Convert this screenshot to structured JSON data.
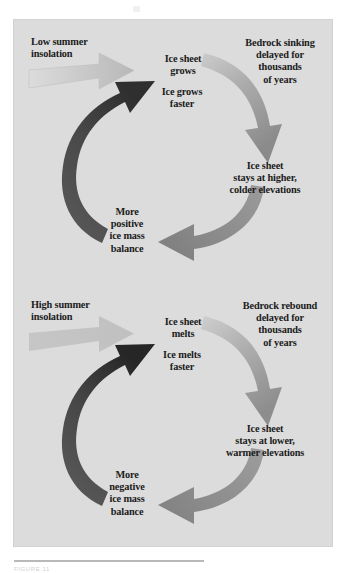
{
  "figure": {
    "background_color": "#ffffff",
    "panel_color": "#dcdcdc",
    "text_color": "#1b1b1b",
    "caption": "FIGURE 11"
  },
  "colors": {
    "input_arrow_light": "#c7c7c7",
    "input_arrow_fade": "#e8e8e8",
    "curve_arrow_light": "#c2c2c2",
    "curve_arrow_mid": "#8d8d8d",
    "curve_arrow_dark": "#6e6e6e",
    "feedback_arrow_dark": "#4a4a4a",
    "feedback_arrow_darker": "#2c2c2c"
  },
  "diagram_data": {
    "type": "diagram",
    "title": "Ice sheet and bedrock delayed-response feedback cycles",
    "cycles": [
      {
        "id": "glacial-growth",
        "name": "Low summer insolation positive feedback cycle",
        "input": {
          "label": "Low summer\ninsolation",
          "arrow": "gradient-fade-right",
          "arrow_color": "#c7c7c7"
        },
        "nodes": [
          {
            "id": "ice-sheet-grows",
            "label": "Ice sheet\ngrows",
            "position": "top-center"
          },
          {
            "id": "bedrock-sinking",
            "label": "Bedrock sinking\ndelayed for\nthousands\nof years",
            "position": "top-right"
          },
          {
            "id": "stays-higher",
            "label": "Ice sheet\nstays at higher,\ncolder elevations",
            "position": "bottom-right"
          },
          {
            "id": "mass-balance-positive",
            "label": "More\npositive\nice mass\nbalance",
            "position": "bottom-left"
          },
          {
            "id": "ice-grows-faster",
            "label": "Ice grows\nfaster",
            "position": "center-left"
          }
        ],
        "arrows": [
          {
            "id": "arrow-grows-to-bedrock",
            "from": "ice-sheet-grows",
            "to": "stays-higher",
            "style": "curved-clockwise",
            "shade": "light-to-mid"
          },
          {
            "id": "arrow-stays-to-balance",
            "from": "stays-higher",
            "to": "mass-balance-positive",
            "style": "curved-clockwise",
            "shade": "mid"
          },
          {
            "id": "arrow-balance-to-faster",
            "from": "mass-balance-positive",
            "to": "ice-grows-faster",
            "style": "curved-clockwise-dark",
            "shade": "dark"
          }
        ]
      },
      {
        "id": "deglaciation",
        "name": "High summer insolation negative feedback cycle",
        "input": {
          "label": "High summer\ninsolation",
          "arrow": "solid-light",
          "arrow_color": "#c7c7c7"
        },
        "nodes": [
          {
            "id": "ice-sheet-melts",
            "label": "Ice sheet\nmelts",
            "position": "top-center"
          },
          {
            "id": "bedrock-rebound",
            "label": "Bedrock rebound\ndelayed for\nthousands\nof years",
            "position": "top-right"
          },
          {
            "id": "stays-lower",
            "label": "Ice sheet\nstays at lower,\nwarmer elevations",
            "position": "bottom-right"
          },
          {
            "id": "mass-balance-negative",
            "label": "More\nnegative\nice mass\nbalance",
            "position": "bottom-left"
          },
          {
            "id": "ice-melts-faster",
            "label": "Ice melts\nfaster",
            "position": "center-left"
          }
        ],
        "arrows": [
          {
            "id": "arrow-melts-to-rebound",
            "from": "ice-sheet-melts",
            "to": "stays-lower",
            "style": "curved-clockwise",
            "shade": "light-to-mid"
          },
          {
            "id": "arrow-stays-to-balance",
            "from": "stays-lower",
            "to": "mass-balance-negative",
            "style": "curved-clockwise",
            "shade": "mid"
          },
          {
            "id": "arrow-balance-to-faster",
            "from": "mass-balance-negative",
            "to": "ice-melts-faster",
            "style": "curved-clockwise-dark",
            "shade": "dark"
          }
        ]
      }
    ]
  },
  "top_cycle": {
    "insolation": "Low summer\ninsolation",
    "ice_sheet": "Ice sheet\ngrows",
    "ice_faster": "Ice grows\nfaster",
    "bedrock": "Bedrock sinking\ndelayed for\nthousands\nof years",
    "stays": "Ice sheet\nstays at higher,\ncolder elevations",
    "balance": "More\npositive\nice mass\nbalance"
  },
  "bottom_cycle": {
    "insolation": "High summer\ninsolation",
    "ice_sheet": "Ice sheet\nmelts",
    "ice_faster": "Ice melts\nfaster",
    "bedrock": "Bedrock rebound\ndelayed for\nthousands\nof years",
    "stays": "Ice sheet\nstays at lower,\nwarmer elevations",
    "balance": "More\nnegative\nice mass\nbalance"
  }
}
